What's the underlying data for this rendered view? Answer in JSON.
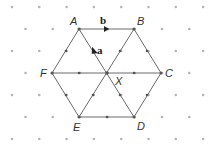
{
  "diagram": {
    "title": "",
    "grid": {
      "type": "isometric-dots",
      "spacing": 27,
      "row_spacing": 22.5,
      "dot_color": "#aaaaaa"
    },
    "points": {
      "A": {
        "label": "A",
        "x": 79,
        "y": 29
      },
      "B": {
        "label": "B",
        "x": 134,
        "y": 29
      },
      "C": {
        "label": "C",
        "x": 161,
        "y": 73
      },
      "D": {
        "label": "D",
        "x": 134,
        "y": 117
      },
      "E": {
        "label": "E",
        "x": 79,
        "y": 117
      },
      "F": {
        "label": "F",
        "x": 52,
        "y": 73
      },
      "X": {
        "label": "X",
        "x": 107,
        "y": 73
      }
    },
    "vectors": {
      "a": {
        "label": "a",
        "from": "X",
        "to": "A"
      },
      "b": {
        "label": "b",
        "from": "A",
        "to": "B"
      }
    },
    "line_color": "#666666"
  }
}
